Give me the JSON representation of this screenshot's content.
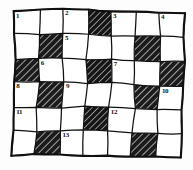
{
  "figure": {
    "background_color": "#fdfdfd",
    "ink_color": "#111111",
    "hatch_color": "#1a1a1a",
    "cell_fill_color": "#ffffff"
  },
  "grid": {
    "columns": 7,
    "rows": 6,
    "style": "hand-drawn-wobbly",
    "left": 13,
    "top": 12,
    "right": 182,
    "bottom": 157,
    "blocked_label": "hatched",
    "open_label": "open",
    "cells": [
      [
        {
          "state": "open",
          "number": "1"
        },
        {
          "state": "open",
          "number": ""
        },
        {
          "state": "open",
          "number": "2"
        },
        {
          "state": "hatched",
          "number": ""
        },
        {
          "state": "open",
          "number": "3"
        },
        {
          "state": "open",
          "number": ""
        },
        {
          "state": "open",
          "number": "4"
        }
      ],
      [
        {
          "state": "open",
          "number": ""
        },
        {
          "state": "hatched",
          "number": ""
        },
        {
          "state": "open",
          "number": "5"
        },
        {
          "state": "open",
          "number": ""
        },
        {
          "state": "open",
          "number": ""
        },
        {
          "state": "hatched",
          "number": ""
        },
        {
          "state": "open",
          "number": ""
        }
      ],
      [
        {
          "state": "hatched",
          "number": ""
        },
        {
          "state": "open",
          "number": "6"
        },
        {
          "state": "open",
          "number": ""
        },
        {
          "state": "hatched",
          "number": ""
        },
        {
          "state": "open",
          "number": "7"
        },
        {
          "state": "open",
          "number": ""
        },
        {
          "state": "hatched",
          "number": ""
        }
      ],
      [
        {
          "state": "open",
          "number": "8"
        },
        {
          "state": "hatched",
          "number": ""
        },
        {
          "state": "open",
          "number": "9"
        },
        {
          "state": "open",
          "number": ""
        },
        {
          "state": "open",
          "number": ""
        },
        {
          "state": "hatched",
          "number": ""
        },
        {
          "state": "open",
          "number": "10"
        }
      ],
      [
        {
          "state": "open",
          "number": "11"
        },
        {
          "state": "open",
          "number": ""
        },
        {
          "state": "open",
          "number": ""
        },
        {
          "state": "hatched",
          "number": ""
        },
        {
          "state": "open",
          "number": "12"
        },
        {
          "state": "open",
          "number": ""
        },
        {
          "state": "open",
          "number": ""
        }
      ],
      [
        {
          "state": "open",
          "number": ""
        },
        {
          "state": "hatched",
          "number": ""
        },
        {
          "state": "open",
          "number": "13"
        },
        {
          "state": "open",
          "number": ""
        },
        {
          "state": "open",
          "number": ""
        },
        {
          "state": "hatched",
          "number": ""
        },
        {
          "state": "open",
          "number": ""
        }
      ]
    ]
  }
}
